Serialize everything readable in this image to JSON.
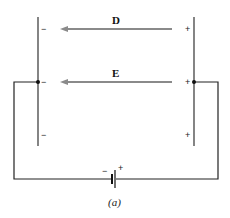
{
  "diagram": {
    "caption": "(a)",
    "field_labels": {
      "D": "D",
      "E": "E"
    },
    "left_plate_signs": [
      "−",
      "−",
      "−"
    ],
    "right_plate_signs": [
      "+",
      "+",
      "+"
    ],
    "battery": {
      "neg": "−",
      "pos": "+"
    },
    "colors": {
      "wire": "#222222",
      "arrow": "#8a8a8a",
      "plate": "#333333"
    }
  }
}
